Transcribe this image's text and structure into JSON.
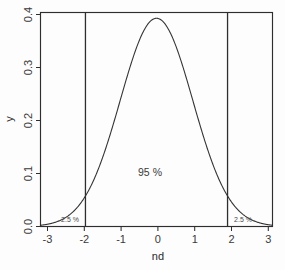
{
  "figure": {
    "kind": "statistical-density-plot",
    "background_color": "#fdfdfd",
    "line_color": "#2e2e2e",
    "curve_color": "#343434"
  },
  "annotations": {
    "center_label": "95 %",
    "left_tail_label": "2.5 %",
    "right_tail_label": "2.5 %"
  },
  "chart_data": {
    "type": "line",
    "title": "",
    "subtitle": "",
    "xlabel": "nd",
    "ylabel": "y",
    "xlim": [
      -3.2,
      3.2
    ],
    "ylim": [
      0.0,
      0.41
    ],
    "xticks": [
      -3,
      -2,
      -1,
      0,
      1,
      2,
      3
    ],
    "xticklabels": [
      "-3",
      "-2",
      "-1",
      "0",
      "1",
      "2",
      "3"
    ],
    "yticks": [
      0.0,
      0.1,
      0.2,
      0.3,
      0.4
    ],
    "yticklabels": [
      "0.0",
      "0.1",
      "0.2",
      "0.3",
      "0.4"
    ],
    "grid": false,
    "legend": false,
    "legend_position": "none",
    "series": [
      {
        "name": "standard normal density",
        "distribution": "normal",
        "mean": 0,
        "sd": 1,
        "peak_value": 0.3989,
        "x": [
          -3.2,
          -3.0,
          -2.8,
          -2.6,
          -2.4,
          -2.2,
          -2.0,
          -1.96,
          -1.8,
          -1.6,
          -1.4,
          -1.2,
          -1.0,
          -0.8,
          -0.6,
          -0.4,
          -0.2,
          0.0,
          0.2,
          0.4,
          0.6,
          0.8,
          1.0,
          1.2,
          1.4,
          1.6,
          1.8,
          1.96,
          2.0,
          2.2,
          2.4,
          2.6,
          2.8,
          3.0,
          3.2
        ],
        "y": [
          0.0024,
          0.0044,
          0.0079,
          0.0136,
          0.0224,
          0.0355,
          0.054,
          0.0584,
          0.079,
          0.1109,
          0.1497,
          0.1942,
          0.242,
          0.2897,
          0.3332,
          0.3683,
          0.391,
          0.3989,
          0.391,
          0.3683,
          0.3332,
          0.2897,
          0.242,
          0.1942,
          0.1497,
          0.1109,
          0.079,
          0.0584,
          0.054,
          0.0355,
          0.0224,
          0.0136,
          0.0079,
          0.0044,
          0.0024
        ]
      }
    ],
    "vertical_lines": [
      {
        "name": "lower-critical-value",
        "x": -1.96
      },
      {
        "name": "upper-critical-value",
        "x": 1.96
      }
    ],
    "annotations": [
      {
        "text": "95 %",
        "x": -0.2,
        "y": 0.105,
        "region": "center"
      },
      {
        "text": "2.5 %",
        "x": -2.35,
        "y": 0.018,
        "region": "left-tail"
      },
      {
        "text": "2.5 %",
        "x": 2.15,
        "y": 0.018,
        "region": "right-tail"
      }
    ]
  }
}
